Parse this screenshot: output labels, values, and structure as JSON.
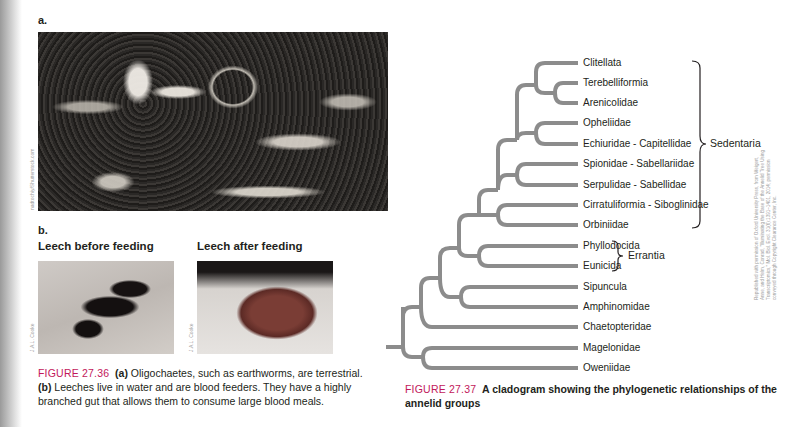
{
  "left_figure": {
    "panel_a_label": "a.",
    "panel_a_credit": "nadtochiy/Shutterstock.com",
    "panel_b_label": "b.",
    "photos": [
      {
        "title": "Leech before feeding",
        "credit": "J.A.L. Cooke"
      },
      {
        "title": "Leech after feeding",
        "credit": "J.A.L. Cooke"
      }
    ],
    "caption": {
      "figure_number": "FIGURE 27.36",
      "part_a_marker": "(a)",
      "part_a_text": " Oligochaetes, such as earthworms, are terrestrial.",
      "part_b_marker": "(b)",
      "part_b_text": " Leeches live in water and are blood feeders. They have a highly branched gut that allows them to consume large blood meals."
    }
  },
  "right_figure": {
    "taxa": [
      "Clitellata",
      "Terebelliformia",
      "Arenicolidae",
      "Opheliidae",
      "Echiuridae - Capitellidae",
      "Spionidae - Sabellariidae",
      "Serpulidae - Sabellidae",
      "Cirratuliformia - Siboglinidae",
      "Orbiniidae",
      "Phyllodocida",
      "Eunicida",
      "Sipuncula",
      "Amphinomidae",
      "Chaetopteridae",
      "Magelonidae",
      "Oweniidae"
    ],
    "groups": [
      {
        "name": "Sedentaria",
        "from": "Clitellata",
        "to": "Orbiniidae"
      },
      {
        "name": "Errantia",
        "from": "Phyllodocida",
        "to": "Eunicida"
      }
    ],
    "branch_color": "#8c8c8c",
    "caption": {
      "figure_number": "FIGURE 27.37",
      "text": "A cladogram showing the phylogenetic relationships of the annelid groups"
    },
    "credit": "Republished with permission of Oxford University Press, from Weigert, Anne, and Helm, Conrad, \"Illuminating the Base of the Annelid Tree Using Transcriptomics,\" Mol. Biol. Evol. 31(6):1391–1401, 2014; permission conveyed through Copyright Clearance Center, Inc."
  }
}
